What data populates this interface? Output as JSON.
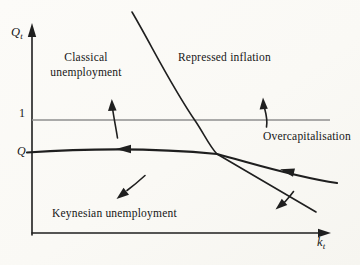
{
  "figure": {
    "colors": {
      "background": "#fbfaf7",
      "ink": "#1f1f1f",
      "unity_line": "#8f8f8f"
    },
    "axes": {
      "y_label_main": "Q",
      "y_label_sub": "t",
      "x_label_main": "k",
      "x_label_sub": "t",
      "tick_one": "1",
      "tick_q": "Q"
    },
    "regions": {
      "classical_line1": "Classical",
      "classical_line2": "unemployment",
      "repressed": "Repressed inflation",
      "overcapitalisation": "Overcapitalisation",
      "keynesian": "Keynesian unemployment"
    }
  }
}
